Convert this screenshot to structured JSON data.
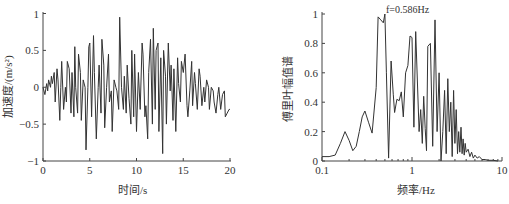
{
  "chart_data": [
    {
      "type": "line",
      "title": "",
      "xlabel": "时间/s",
      "ylabel": "加速度/(m/s²)",
      "xlim": [
        0,
        20
      ],
      "ylim": [
        -1,
        1
      ],
      "xticks": [
        0,
        5,
        10,
        15,
        20
      ],
      "xtick_labels": [
        "0",
        "5",
        "10",
        "15",
        "20"
      ],
      "yticks": [
        -1,
        -0.5,
        0,
        0.5,
        1
      ],
      "ytick_labels": [
        "−1",
        "−0.5",
        "0",
        "0.5",
        "1"
      ],
      "grid": false,
      "series": [
        {
          "name": "acceleration",
          "x": [
            0.0,
            0.2,
            0.4,
            0.5,
            0.6,
            0.8,
            0.9,
            1.0,
            1.2,
            1.3,
            1.5,
            1.6,
            1.8,
            1.9,
            2.0,
            2.2,
            2.4,
            2.5,
            2.6,
            2.8,
            3.0,
            3.1,
            3.3,
            3.4,
            3.5,
            3.7,
            3.8,
            4.0,
            4.1,
            4.3,
            4.5,
            4.6,
            4.8,
            4.9,
            5.0,
            5.2,
            5.4,
            5.5,
            5.7,
            5.9,
            6.0,
            6.2,
            6.3,
            6.5,
            6.6,
            6.8,
            7.0,
            7.1,
            7.3,
            7.4,
            7.6,
            7.8,
            7.9,
            8.1,
            8.2,
            8.4,
            8.6,
            8.7,
            8.9,
            9.0,
            9.2,
            9.4,
            9.5,
            9.7,
            9.8,
            10.0,
            10.2,
            10.4,
            10.6,
            10.7,
            10.9,
            11.0,
            11.2,
            11.3,
            11.5,
            11.7,
            11.8,
            12.0,
            12.1,
            12.3,
            12.4,
            12.6,
            12.8,
            12.9,
            13.1,
            13.2,
            13.4,
            13.6,
            13.7,
            13.9,
            14.0,
            14.2,
            14.4,
            14.5,
            14.7,
            14.8,
            15.0,
            15.2,
            15.4,
            15.5,
            15.7,
            15.9,
            16.0,
            16.2,
            16.3,
            16.5,
            16.7,
            16.8,
            17.0,
            17.2,
            17.3,
            17.5,
            17.7,
            17.8,
            18.0,
            18.2,
            18.3,
            18.5,
            18.7,
            18.8,
            19.0,
            19.2,
            19.4,
            19.5,
            19.7,
            19.9,
            20.0
          ],
          "y": [
            0.0,
            -0.1,
            0.05,
            -0.05,
            0.1,
            0.0,
            0.15,
            0.05,
            0.2,
            -0.2,
            0.25,
            0.1,
            -0.45,
            0.0,
            0.35,
            -0.3,
            0.0,
            -0.2,
            0.35,
            0.25,
            -0.35,
            0.2,
            -0.4,
            0.55,
            0.0,
            -0.35,
            0.45,
            0.2,
            -0.45,
            0.1,
            0.0,
            -0.85,
            0.0,
            0.55,
            0.6,
            -0.4,
            0.7,
            0.2,
            -0.7,
            0.0,
            0.3,
            -0.35,
            0.65,
            0.3,
            -0.55,
            0.0,
            0.45,
            -0.2,
            -0.05,
            -0.6,
            0.1,
            0.0,
            -0.05,
            -0.3,
            0.95,
            0.0,
            -0.3,
            0.15,
            -0.35,
            0.3,
            -0.15,
            -0.5,
            0.5,
            -0.4,
            0.45,
            -0.6,
            0.2,
            -0.3,
            0.6,
            0.45,
            -0.4,
            -0.25,
            -0.7,
            0.2,
            0.65,
            -0.5,
            0.8,
            -0.3,
            0.5,
            0.6,
            -0.6,
            0.4,
            -0.9,
            0.5,
            0.15,
            -0.5,
            0.6,
            -0.05,
            0.3,
            -0.45,
            0.25,
            -0.6,
            0.4,
            0.05,
            -0.2,
            0.35,
            0.2,
            0.45,
            -0.25,
            -0.4,
            -0.05,
            0.35,
            -0.25,
            0.2,
            0.05,
            -0.3,
            0.25,
            0.15,
            -0.25,
            0.0,
            -0.2,
            0.1,
            0.0,
            -0.3,
            0.0,
            -0.05,
            -0.2,
            -0.35,
            -0.1,
            0.0,
            -0.3,
            -0.1,
            -0.05,
            -0.4,
            -0.35,
            -0.3,
            -0.3
          ],
          "color": "#333333"
        }
      ]
    },
    {
      "type": "line",
      "title": "",
      "xlabel": "频率/Hz",
      "ylabel": "傅里叶幅值谱",
      "xscale": "log",
      "xlim": [
        0.1,
        10
      ],
      "ylim": [
        0,
        1
      ],
      "xticks": [
        0.1,
        1,
        10
      ],
      "xtick_labels": [
        "0.1",
        "1",
        "10"
      ],
      "yticks": [
        0,
        0.2,
        0.4,
        0.6,
        0.8,
        1
      ],
      "ytick_labels": [
        "0",
        "0.2",
        "0.4",
        "0.6",
        "0.8",
        "1"
      ],
      "grid": false,
      "annotations": [
        {
          "text": "f=0.586Hz",
          "x": 0.586,
          "y": 1.0
        }
      ],
      "series": [
        {
          "name": "fourier_amplitude",
          "x": [
            0.1,
            0.12,
            0.14,
            0.16,
            0.18,
            0.2,
            0.22,
            0.24,
            0.26,
            0.28,
            0.3,
            0.33,
            0.36,
            0.4,
            0.42,
            0.45,
            0.48,
            0.5,
            0.52,
            0.55,
            0.586,
            0.62,
            0.64,
            0.68,
            0.72,
            0.76,
            0.8,
            0.85,
            0.9,
            0.95,
            1.0,
            1.05,
            1.1,
            1.2,
            1.25,
            1.3,
            1.35,
            1.4,
            1.45,
            1.5,
            1.6,
            1.7,
            1.8,
            1.9,
            2.0,
            2.1,
            2.2,
            2.3,
            2.4,
            2.5,
            2.6,
            2.7,
            2.8,
            2.9,
            3.0,
            3.1,
            3.2,
            3.3,
            3.4,
            3.5,
            3.6,
            3.7,
            3.8,
            3.9,
            4.0,
            4.2,
            4.4,
            4.6,
            4.8,
            5.0,
            5.3,
            5.6,
            6.0,
            6.5,
            7.0,
            8.0,
            9.0,
            10.0
          ],
          "y": [
            0.03,
            0.03,
            0.04,
            0.12,
            0.2,
            0.14,
            0.07,
            0.1,
            0.2,
            0.3,
            0.34,
            0.26,
            0.19,
            0.5,
            0.98,
            0.96,
            0.94,
            1.0,
            0.6,
            0.02,
            0.68,
            0.45,
            0.33,
            0.42,
            0.41,
            0.47,
            0.3,
            0.6,
            0.65,
            0.85,
            0.84,
            0.23,
            0.88,
            0.2,
            0.35,
            0.12,
            0.44,
            0.22,
            0.07,
            0.78,
            0.8,
            0.1,
            0.96,
            0.2,
            0.6,
            0.0,
            0.2,
            0.48,
            0.05,
            0.56,
            0.2,
            0.4,
            0.03,
            0.48,
            0.12,
            0.35,
            0.05,
            0.2,
            0.06,
            0.23,
            0.05,
            0.15,
            0.04,
            0.12,
            0.06,
            0.08,
            0.03,
            0.06,
            0.02,
            0.04,
            0.02,
            0.03,
            0.01,
            0.01,
            0.005,
            0.005,
            0.0
          ],
          "color": "#333333"
        }
      ]
    }
  ]
}
